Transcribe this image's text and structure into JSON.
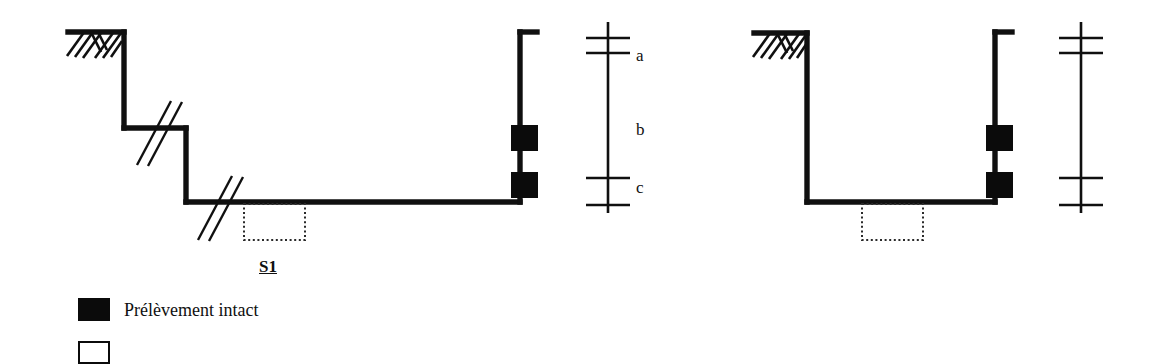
{
  "figure": {
    "stroke_color": "#101010",
    "fill_color": "#0b0b0b",
    "background_color": "#ffffff",
    "dotted_color": "#2a2a2a"
  },
  "left_diagram": {
    "name": "stepped-excavation-section",
    "section_tag": "S1",
    "ground_hatch": "ground-surface-hatching",
    "break_symbols": 3,
    "samples": 2,
    "steps": 3
  },
  "right_diagram": {
    "name": "vertical-excavation-section",
    "ground_hatch": "ground-surface-hatching",
    "break_symbols": 0,
    "samples": 2,
    "steps": 1
  },
  "left_scale": {
    "name": "depth-scale-left",
    "labels": [
      "a",
      "b",
      "c"
    ],
    "label_a": "a",
    "label_b": "b",
    "label_c": "c",
    "tick_count": 4
  },
  "right_scale": {
    "name": "depth-scale-right",
    "labels": [],
    "tick_count": 4
  },
  "legend": {
    "items": [
      {
        "swatch": "filled-square",
        "label": "Prélèvement intact"
      },
      {
        "swatch": "hollow-square",
        "label": ""
      }
    ],
    "item0_label": "Prélèvement intact",
    "item1_label": ""
  }
}
